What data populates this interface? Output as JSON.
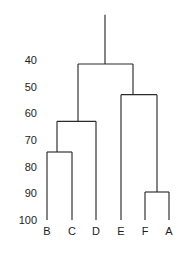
{
  "chart_data": {
    "type": "dendrogram",
    "title": "",
    "xlabel": "",
    "ylabel": "",
    "orientation": "vertical-top-down",
    "axis": {
      "ticks": [
        40,
        50,
        60,
        70,
        80,
        90,
        100
      ],
      "tick_labels": [
        "40",
        "50",
        "60",
        "70",
        "80",
        "90",
        "100"
      ],
      "range": [
        36,
        103
      ],
      "inverted": true,
      "grid": false
    },
    "leaves": [
      {
        "label": "B",
        "x": 47
      },
      {
        "label": "C",
        "x": 72
      },
      {
        "label": "D",
        "x": 96
      },
      {
        "label": "E",
        "x": 121
      },
      {
        "label": "F",
        "x": 145
      },
      {
        "label": "A",
        "x": 169
      }
    ],
    "leaf_baseline": 100,
    "merges": [
      {
        "name": "merge-b-c",
        "members": [
          "B",
          "C"
        ],
        "height": 74.5,
        "left_x": 47,
        "right_x": 72,
        "node_x": 57
      },
      {
        "name": "merge-bc-d",
        "members": [
          "B",
          "C",
          "D"
        ],
        "height": 63.0,
        "left_x": 57,
        "right_x": 96,
        "node_x": 78
      },
      {
        "name": "merge-f-a",
        "members": [
          "F",
          "A"
        ],
        "height": 89.5,
        "left_x": 145,
        "right_x": 169,
        "node_x": 157
      },
      {
        "name": "merge-e-fa",
        "members": [
          "E",
          "F",
          "A"
        ],
        "height": 53.0,
        "left_x": 121,
        "right_x": 157,
        "node_x": 133
      },
      {
        "name": "merge-root",
        "members": [
          "B",
          "C",
          "D",
          "E",
          "F",
          "A"
        ],
        "height": 41.5,
        "left_x": 78,
        "right_x": 133,
        "node_x": 105
      }
    ],
    "root_stem_top_height": 23.0
  }
}
